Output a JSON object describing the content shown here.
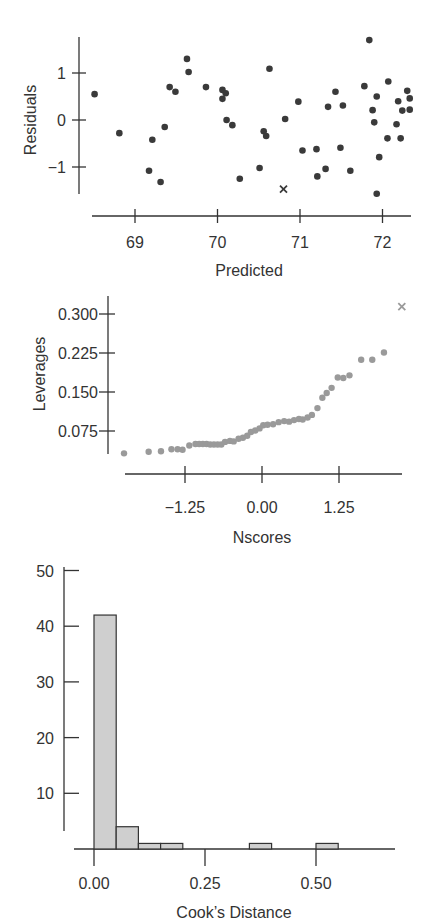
{
  "chart_data": [
    {
      "type": "scatter",
      "title": "",
      "xlabel": "Predicted",
      "ylabel": "Residuals",
      "xlim": [
        68.45,
        72.4
      ],
      "ylim": [
        -1.6,
        1.75
      ],
      "xticks": [
        69,
        70,
        71,
        72
      ],
      "xtick_labels": [
        "69",
        "70",
        "71",
        "72"
      ],
      "yticks": [
        1,
        0,
        -1
      ],
      "ytick_labels": [
        "1",
        "0",
        "−1"
      ],
      "grid": false,
      "legend": null,
      "marker_color": "#3a3a3a",
      "points": [
        {
          "x": 68.51,
          "y": 0.55
        },
        {
          "x": 68.81,
          "y": -0.28
        },
        {
          "x": 69.17,
          "y": -1.08
        },
        {
          "x": 69.21,
          "y": -0.42
        },
        {
          "x": 69.31,
          "y": -1.32
        },
        {
          "x": 69.36,
          "y": -0.15
        },
        {
          "x": 69.42,
          "y": 0.7
        },
        {
          "x": 69.49,
          "y": 0.6
        },
        {
          "x": 69.63,
          "y": 1.3
        },
        {
          "x": 69.65,
          "y": 1.02
        },
        {
          "x": 69.86,
          "y": 0.7
        },
        {
          "x": 70.06,
          "y": 0.64
        },
        {
          "x": 70.1,
          "y": 0.57
        },
        {
          "x": 70.06,
          "y": 0.45
        },
        {
          "x": 70.11,
          "y": 0.0
        },
        {
          "x": 70.18,
          "y": -0.11
        },
        {
          "x": 70.27,
          "y": -1.25
        },
        {
          "x": 70.51,
          "y": -1.02
        },
        {
          "x": 70.56,
          "y": -0.24
        },
        {
          "x": 70.59,
          "y": -0.34
        },
        {
          "x": 70.63,
          "y": 1.09
        },
        {
          "x": 70.82,
          "y": 0.02
        },
        {
          "x": 70.98,
          "y": 0.39
        },
        {
          "x": 71.03,
          "y": -0.65
        },
        {
          "x": 71.2,
          "y": -0.62
        },
        {
          "x": 71.21,
          "y": -1.2
        },
        {
          "x": 71.31,
          "y": -1.04
        },
        {
          "x": 71.34,
          "y": 0.28
        },
        {
          "x": 71.43,
          "y": 0.6
        },
        {
          "x": 71.49,
          "y": -0.59
        },
        {
          "x": 71.52,
          "y": 0.31
        },
        {
          "x": 71.61,
          "y": -1.08
        },
        {
          "x": 71.78,
          "y": 0.72
        },
        {
          "x": 71.84,
          "y": 1.7
        },
        {
          "x": 71.88,
          "y": 0.21
        },
        {
          "x": 71.9,
          "y": -0.05
        },
        {
          "x": 71.93,
          "y": 0.5
        },
        {
          "x": 71.93,
          "y": -1.57
        },
        {
          "x": 71.96,
          "y": -0.79
        },
        {
          "x": 72.07,
          "y": 0.82
        },
        {
          "x": 72.06,
          "y": -0.39
        },
        {
          "x": 72.17,
          "y": -0.09
        },
        {
          "x": 72.19,
          "y": 0.4
        },
        {
          "x": 72.22,
          "y": -0.39
        },
        {
          "x": 72.24,
          "y": 0.2
        },
        {
          "x": 72.3,
          "y": 0.62
        },
        {
          "x": 72.33,
          "y": 0.46
        },
        {
          "x": 72.33,
          "y": 0.22
        }
      ],
      "highlighted_points": [
        {
          "x": 70.8,
          "y": -1.47,
          "marker": "x"
        }
      ]
    },
    {
      "type": "scatter",
      "title": "",
      "xlabel": "Nscores",
      "ylabel": "Leverages",
      "xlim": [
        -2.25,
        2.25
      ],
      "ylim": [
        0.02,
        0.33
      ],
      "xticks": [
        -1.25,
        0.0,
        1.25
      ],
      "xtick_labels": [
        "−1.25",
        "0.00",
        "1.25"
      ],
      "yticks": [
        0.3,
        0.225,
        0.15,
        0.075
      ],
      "ytick_labels": [
        "0.300",
        "0.225",
        "0.150",
        "0.075"
      ],
      "grid": false,
      "legend": null,
      "marker_color": "#9a9a9a",
      "points": [
        {
          "x": -2.24,
          "y": 0.032
        },
        {
          "x": -1.84,
          "y": 0.035
        },
        {
          "x": -1.64,
          "y": 0.036
        },
        {
          "x": -1.47,
          "y": 0.04
        },
        {
          "x": -1.37,
          "y": 0.04
        },
        {
          "x": -1.29,
          "y": 0.039
        },
        {
          "x": -1.18,
          "y": 0.047
        },
        {
          "x": -1.08,
          "y": 0.05
        },
        {
          "x": -1.02,
          "y": 0.05
        },
        {
          "x": -0.96,
          "y": 0.05
        },
        {
          "x": -0.9,
          "y": 0.05
        },
        {
          "x": -0.84,
          "y": 0.049
        },
        {
          "x": -0.78,
          "y": 0.049
        },
        {
          "x": -0.72,
          "y": 0.049
        },
        {
          "x": -0.66,
          "y": 0.049
        },
        {
          "x": -0.6,
          "y": 0.054
        },
        {
          "x": -0.52,
          "y": 0.056
        },
        {
          "x": -0.46,
          "y": 0.055
        },
        {
          "x": -0.38,
          "y": 0.06
        },
        {
          "x": -0.31,
          "y": 0.062
        },
        {
          "x": -0.24,
          "y": 0.066
        },
        {
          "x": -0.18,
          "y": 0.073
        },
        {
          "x": -0.11,
          "y": 0.076
        },
        {
          "x": -0.04,
          "y": 0.08
        },
        {
          "x": 0.02,
          "y": 0.086
        },
        {
          "x": 0.09,
          "y": 0.087
        },
        {
          "x": 0.18,
          "y": 0.088
        },
        {
          "x": 0.27,
          "y": 0.092
        },
        {
          "x": 0.36,
          "y": 0.094
        },
        {
          "x": 0.44,
          "y": 0.093
        },
        {
          "x": 0.52,
          "y": 0.096
        },
        {
          "x": 0.6,
          "y": 0.098
        },
        {
          "x": 0.66,
          "y": 0.097
        },
        {
          "x": 0.74,
          "y": 0.101
        },
        {
          "x": 0.81,
          "y": 0.106
        },
        {
          "x": 0.9,
          "y": 0.119
        },
        {
          "x": 0.98,
          "y": 0.139
        },
        {
          "x": 1.05,
          "y": 0.148
        },
        {
          "x": 1.13,
          "y": 0.158
        },
        {
          "x": 1.23,
          "y": 0.178
        },
        {
          "x": 1.32,
          "y": 0.177
        },
        {
          "x": 1.42,
          "y": 0.182
        },
        {
          "x": 1.61,
          "y": 0.212
        },
        {
          "x": 1.79,
          "y": 0.212
        },
        {
          "x": 1.98,
          "y": 0.226
        }
      ],
      "highlighted_points": [
        {
          "x": 2.27,
          "y": 0.314,
          "marker": "x"
        }
      ]
    },
    {
      "type": "bar",
      "subtype": "histogram",
      "title": "",
      "xlabel": "Cook’s Distance",
      "ylabel": "",
      "xlim": [
        -0.03,
        0.68
      ],
      "ylim": [
        0,
        50
      ],
      "xticks": [
        0.0,
        0.25,
        0.5
      ],
      "xtick_labels": [
        "0.00",
        "0.25",
        "0.50"
      ],
      "yticks": [
        50,
        40,
        30,
        20,
        10
      ],
      "ytick_labels": [
        "50",
        "40",
        "30",
        "20",
        "10"
      ],
      "grid": false,
      "legend": null,
      "bar_color": "#cfcfcf",
      "bins": [
        {
          "start": 0.0,
          "end": 0.05,
          "count": 42
        },
        {
          "start": 0.05,
          "end": 0.1,
          "count": 4
        },
        {
          "start": 0.1,
          "end": 0.15,
          "count": 1
        },
        {
          "start": 0.15,
          "end": 0.2,
          "count": 1
        },
        {
          "start": 0.35,
          "end": 0.4,
          "count": 1
        },
        {
          "start": 0.5,
          "end": 0.55,
          "count": 1
        }
      ],
      "categories": [
        "0.00-0.05",
        "0.05-0.10",
        "0.10-0.15",
        "0.15-0.20",
        "0.35-0.40",
        "0.50-0.55"
      ],
      "values": [
        42,
        4,
        1,
        1,
        1,
        1
      ]
    }
  ]
}
